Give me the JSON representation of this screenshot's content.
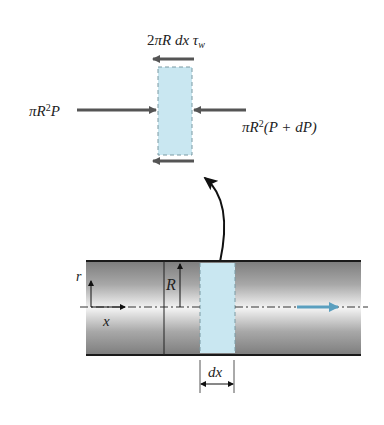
{
  "figure": {
    "type": "free-body diagram of fluid element in pipe flow",
    "colors": {
      "force_arrow": "#555555",
      "element_fill": "#c9e7f1",
      "element_border": "#7a9aa3",
      "pipe_edge": "#1a1a1a",
      "pipe_gradient_dark": "#8a8a8a",
      "pipe_gradient_light": "#f2f2f2",
      "flow_arrow": "#5a9fbf",
      "curve_arrow": "#111111"
    }
  },
  "element": {
    "shear_force_label": {
      "prefix": "2",
      "pi": "π",
      "R": "R",
      "dx": "dx",
      "tau": "τ",
      "sub": "w"
    },
    "left_force_label": {
      "pi": "π",
      "R": "R",
      "exp": "2",
      "P": "P"
    },
    "right_force_label": {
      "pi": "π",
      "R": "R",
      "exp": "2",
      "rest": "(P + dP)"
    }
  },
  "pipe": {
    "r_axis_label": "r",
    "x_axis_label": "x",
    "radius_label": "R",
    "dx_label": "dx"
  }
}
